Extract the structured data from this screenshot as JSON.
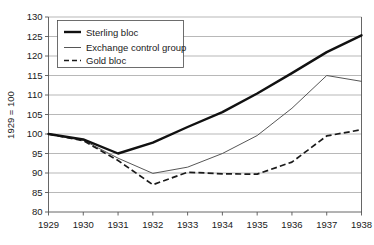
{
  "chart_data": {
    "type": "line",
    "title": "",
    "xlabel": "",
    "ylabel": "1929 = 100",
    "categories": [
      "1929",
      "1930",
      "1931",
      "1932",
      "1933",
      "1934",
      "1935",
      "1936",
      "1937",
      "1938"
    ],
    "x": [
      1929,
      1930,
      1931,
      1932,
      1933,
      1934,
      1935,
      1936,
      1937,
      1938
    ],
    "ylim": [
      80,
      130
    ],
    "yticks": [
      80,
      85,
      90,
      95,
      100,
      105,
      110,
      115,
      120,
      125,
      130
    ],
    "grid": true,
    "legend_position": "top-left",
    "series": [
      {
        "name": "Sterling bloc",
        "style": "thick-solid",
        "values": [
          100.0,
          98.6,
          95.0,
          97.8,
          101.8,
          105.6,
          110.4,
          115.6,
          121.0,
          125.3
        ]
      },
      {
        "name": "Exchange control group",
        "style": "thin-solid",
        "values": [
          100.0,
          98.4,
          93.8,
          89.9,
          91.5,
          95.0,
          99.6,
          106.6,
          115.0,
          113.5
        ]
      },
      {
        "name": "Gold bloc",
        "style": "dashed",
        "values": [
          100.0,
          98.3,
          93.2,
          87.0,
          90.2,
          89.8,
          89.7,
          92.8,
          99.5,
          101.1
        ]
      }
    ]
  },
  "axes": {
    "y_axis_title": "1929 = 100",
    "y_tick_labels": [
      "130",
      "125",
      "120",
      "115",
      "110",
      "105",
      "100",
      "95",
      "90",
      "85",
      "80"
    ],
    "x_tick_labels": [
      "1929",
      "1930",
      "1931",
      "1932",
      "1933",
      "1934",
      "1935",
      "1936",
      "1937",
      "1938"
    ]
  },
  "legend": {
    "items": [
      {
        "label": "Sterling bloc"
      },
      {
        "label": "Exchange control group"
      },
      {
        "label": "Gold bloc"
      }
    ]
  },
  "colors": {
    "sterling": "#111111",
    "exchange": "#4d4d4d",
    "gold": "#1a1a1a",
    "gridline": "#9a9a9a",
    "axis": "#555555",
    "background": "#ffffff"
  }
}
